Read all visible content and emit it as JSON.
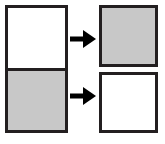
{
  "diagram": {
    "width": 165,
    "height": 144,
    "background_color": "#ffffff",
    "border_color": "#231f20",
    "border_width_px": 3,
    "fill_colors": {
      "shaded": "#c8c8c8",
      "empty": "#ffffff"
    },
    "source": {
      "label": "",
      "description": "Single tall rectangle divided into two equal halves",
      "halves": [
        {
          "name": "top-half",
          "fill": "empty",
          "fill_color": "#ffffff",
          "label": ""
        },
        {
          "name": "bottom-half",
          "fill": "shaded",
          "fill_color": "#c8c8c8",
          "label": ""
        }
      ]
    },
    "result": {
      "label": "",
      "description": "Two separated rectangles with the shading exchanged",
      "boxes": [
        {
          "name": "top-box",
          "fill": "shaded",
          "fill_color": "#c8c8c8",
          "label": ""
        },
        {
          "name": "bottom-box",
          "fill": "empty",
          "fill_color": "#ffffff",
          "label": ""
        }
      ]
    },
    "arrows": [
      {
        "name": "arrow-top",
        "direction": "right",
        "color": "#000000",
        "label": ""
      },
      {
        "name": "arrow-bottom",
        "direction": "right",
        "color": "#000000",
        "label": ""
      }
    ]
  }
}
